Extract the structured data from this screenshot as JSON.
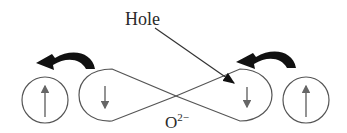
{
  "diagram": {
    "labels": {
      "hole": "Hole",
      "oxygen_base": "O",
      "oxygen_charge": "2−"
    },
    "elements": [
      {
        "id": "left-ion",
        "spin": "up"
      },
      {
        "id": "left-lobe",
        "spin": "down"
      },
      {
        "id": "right-lobe",
        "spin": "down"
      },
      {
        "id": "right-ion",
        "spin": "up"
      }
    ],
    "colors": {
      "stroke": "#555555",
      "arrow_fill": "#111111",
      "text": "#2a2a2a"
    }
  }
}
